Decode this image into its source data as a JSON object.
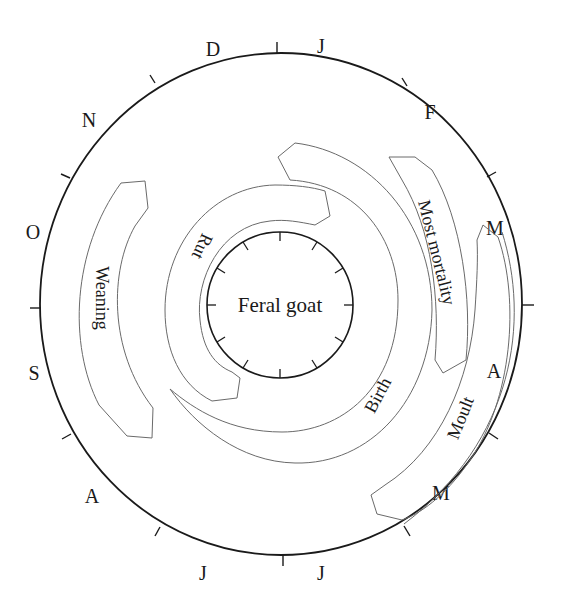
{
  "diagram": {
    "center_label": "Feral goat",
    "colors": {
      "ink": "#1a1a1a",
      "band_stroke": "#6a6a6a",
      "background": "#ffffff"
    },
    "months": [
      {
        "label": "J",
        "x": 321,
        "y": 53
      },
      {
        "label": "F",
        "x": 430,
        "y": 119
      },
      {
        "label": "M",
        "x": 495,
        "y": 235
      },
      {
        "label": "A",
        "x": 494,
        "y": 378
      },
      {
        "label": "M",
        "x": 441,
        "y": 500
      },
      {
        "label": "J",
        "x": 321,
        "y": 580
      },
      {
        "label": "J",
        "x": 203,
        "y": 580
      },
      {
        "label": "A",
        "x": 92,
        "y": 503
      },
      {
        "label": "S",
        "x": 34,
        "y": 380
      },
      {
        "label": "O",
        "x": 33,
        "y": 239
      },
      {
        "label": "N",
        "x": 89,
        "y": 127
      },
      {
        "label": "D",
        "x": 213,
        "y": 56
      }
    ],
    "bands": [
      {
        "name": "Weaning",
        "label": "Weaning"
      },
      {
        "name": "Rut",
        "label": "Rut"
      },
      {
        "name": "Birth",
        "label": "Birth"
      },
      {
        "name": "Most mortality",
        "label": "Most mortality"
      },
      {
        "name": "Moult",
        "label": "Moult"
      }
    ]
  }
}
